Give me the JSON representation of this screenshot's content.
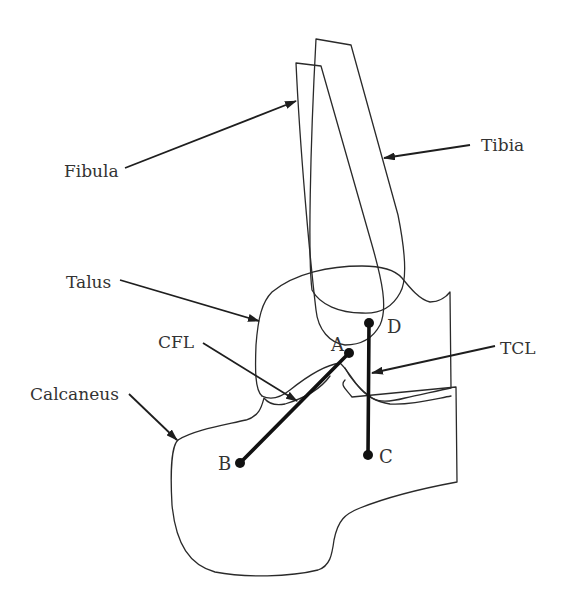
{
  "diagram": {
    "type": "anatomical-line-drawing",
    "colors": {
      "line": "#2a2a2a",
      "ligament": "#111111",
      "text": "#333333",
      "background": "#ffffff"
    },
    "structures": {
      "fibula": {
        "label": "Fibula"
      },
      "tibia": {
        "label": "Tibia"
      },
      "talus": {
        "label": "Talus"
      },
      "calcaneus": {
        "label": "Calcaneus"
      },
      "cfl": {
        "label": "CFL"
      },
      "tcl": {
        "label": "TCL"
      }
    },
    "points": {
      "A": {
        "label": "A",
        "x": 349,
        "y": 353
      },
      "B": {
        "label": "B",
        "x": 240,
        "y": 463
      },
      "C": {
        "label": "C",
        "x": 368,
        "y": 455
      },
      "D": {
        "label": "D",
        "x": 369,
        "y": 323
      }
    },
    "ligament_lines": [
      {
        "from": "A",
        "to": "B"
      },
      {
        "from": "D",
        "to": "C"
      }
    ]
  }
}
